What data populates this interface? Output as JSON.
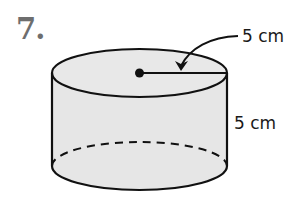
{
  "problem": {
    "number": "7."
  },
  "figure": {
    "shape": "cylinder",
    "fill_color": "#e6e6e6",
    "stroke_color": "#111111",
    "labels": {
      "radius": "5 cm",
      "height": "5 cm"
    }
  }
}
